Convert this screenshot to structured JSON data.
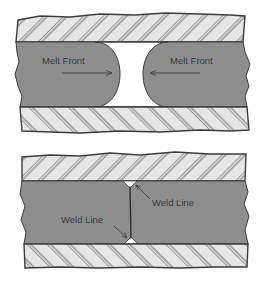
{
  "diagram": {
    "colors": {
      "background": "#ffffff",
      "mold_fill": "#e6e6e6",
      "hatch": "#4a4a4a",
      "outline": "#3c3c3c",
      "melt_fill": "#8e8e8e",
      "text": "#3a3a3a"
    },
    "top_panel": {
      "title": "Melt fronts approaching",
      "labels": {
        "left_front": "Melt Front",
        "right_front": "Melt Front"
      },
      "arrows": {
        "left_direction": "right",
        "right_direction": "left"
      }
    },
    "bottom_panel": {
      "title": "Weld line formed",
      "labels": {
        "upper_weld": "Weld Line",
        "lower_weld": "Weld Line"
      }
    }
  }
}
